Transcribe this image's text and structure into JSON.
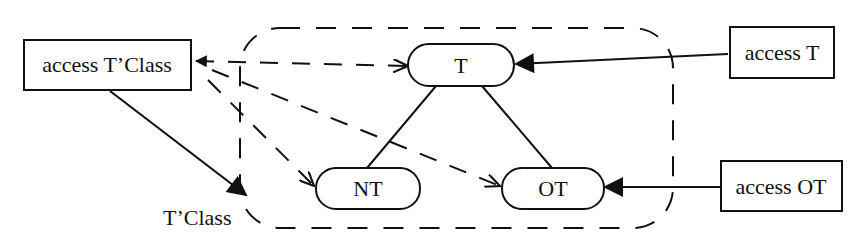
{
  "diagram": {
    "boxes": {
      "access_tclass": "access T’Class",
      "access_t": "access T",
      "access_ot": "access OT"
    },
    "nodes": {
      "t": "T",
      "nt": "NT",
      "ot": "OT"
    },
    "region_label": "T’Class",
    "colors": {
      "stroke": "#111111",
      "background": "#ffffff"
    }
  }
}
